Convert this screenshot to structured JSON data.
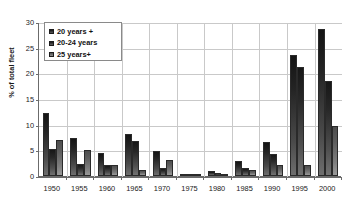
{
  "chart_data": {
    "type": "bar",
    "title": "",
    "xlabel": "",
    "ylabel": "% of total fleet",
    "ylim": [
      0,
      30
    ],
    "yticks": [
      0,
      5,
      10,
      15,
      20,
      25,
      30
    ],
    "grid": true,
    "legend_position": "top-left",
    "categories": [
      "1950",
      "1955",
      "1960",
      "1965",
      "1970",
      "1975",
      "1980",
      "1985",
      "1990",
      "1995",
      "2000"
    ],
    "series": [
      {
        "name": "20 years +",
        "color": "#242424",
        "values": [
          12.2,
          7.4,
          4.5,
          8.2,
          4.8,
          0.3,
          0.9,
          2.9,
          6.6,
          23.6,
          28.6
        ]
      },
      {
        "name": "20-24 years",
        "color": "#282828",
        "values": [
          5.2,
          2.4,
          2.1,
          6.9,
          1.5,
          0.15,
          0.5,
          1.6,
          4.2,
          21.2,
          18.5
        ]
      },
      {
        "name": "25 years+",
        "color": "#7e7e7e",
        "values": [
          7.1,
          5.1,
          2.2,
          1.1,
          3.2,
          0.1,
          0.25,
          1.2,
          2.1,
          2.1,
          9.7
        ]
      }
    ]
  }
}
